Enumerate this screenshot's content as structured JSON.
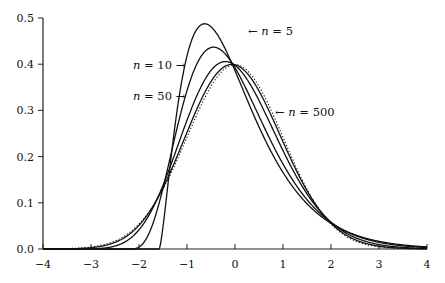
{
  "chart_data": {
    "type": "line",
    "title": "",
    "xlabel": "",
    "ylabel": "",
    "xlim": [
      -4,
      4
    ],
    "ylim": [
      0,
      0.5
    ],
    "grid": false,
    "legend_position": "inline annotations",
    "x_ticks": [
      -4,
      -3,
      -2,
      -1,
      0,
      1,
      2,
      3,
      4
    ],
    "x_tick_labels": [
      "−4",
      "−3",
      "−2",
      "−1",
      "0",
      "1",
      "2",
      "3",
      "4"
    ],
    "y_ticks": [
      0.0,
      0.1,
      0.2,
      0.3,
      0.4,
      0.5
    ],
    "y_tick_labels": [
      "0.0",
      "0.1",
      "0.2",
      "0.3",
      "0.4",
      "0.5"
    ],
    "x": [
      -4,
      -3,
      -2,
      -1.5,
      -1,
      -0.5,
      0,
      0.5,
      1,
      1.5,
      2,
      3,
      4
    ],
    "series": [
      {
        "name": "n = 5",
        "n": 5,
        "style": "solid",
        "peak": [
          -0.63,
          0.488
        ],
        "values": [
          0,
          0,
          0,
          0.048,
          0.418,
          0.481,
          0.386,
          0.264,
          0.166,
          0.098,
          0.056,
          0.017,
          0.005
        ]
      },
      {
        "name": "n = 10",
        "n": 10,
        "style": "solid",
        "peak": [
          -0.45,
          0.437
        ],
        "values": [
          0,
          0,
          0.004,
          0.103,
          0.33,
          0.434,
          0.392,
          0.29,
          0.192,
          0.118,
          0.068,
          0.02,
          0.005
        ]
      },
      {
        "name": "n = 50",
        "n": 50,
        "style": "solid",
        "peak": [
          -0.2,
          0.405
        ],
        "values": [
          0,
          0.001,
          0.04,
          0.139,
          0.27,
          0.383,
          0.4,
          0.336,
          0.23,
          0.13,
          0.061,
          0.008,
          0.001
        ]
      },
      {
        "name": "n = 500",
        "n": 500,
        "style": "solid",
        "peak": [
          -0.06,
          0.4
        ],
        "values": [
          0,
          0.003,
          0.05,
          0.131,
          0.251,
          0.359,
          0.399,
          0.349,
          0.238,
          0.128,
          0.055,
          0.005,
          0.0003
        ]
      },
      {
        "name": "normal",
        "n": null,
        "style": "dotted",
        "peak": [
          0,
          0.399
        ],
        "values": [
          0.0001,
          0.0044,
          0.054,
          0.13,
          0.242,
          0.352,
          0.399,
          0.352,
          0.242,
          0.13,
          0.054,
          0.0044,
          0.0001
        ]
      }
    ],
    "annotations": [
      {
        "text_var": "n",
        "text_rest": " = 5",
        "arrow": "←",
        "arrow_side": "left",
        "x_px": 248,
        "y_px": 35
      },
      {
        "text_var": "n",
        "text_rest": " = 10",
        "arrow": "→",
        "arrow_side": "right",
        "x_px": 133,
        "y_px": 69
      },
      {
        "text_var": "n",
        "text_rest": " = 50",
        "arrow": "→",
        "arrow_side": "right",
        "x_px": 133,
        "y_px": 100
      },
      {
        "text_var": "n",
        "text_rest": " = 500",
        "arrow": "←",
        "arrow_side": "left",
        "x_px": 275,
        "y_px": 116
      }
    ]
  },
  "plot_box": {
    "x0": 43,
    "x1": 427,
    "y_top": 18,
    "y_base": 249
  },
  "colors": {
    "line": "#111111",
    "axis": "#222222",
    "background": "#ffffff"
  }
}
